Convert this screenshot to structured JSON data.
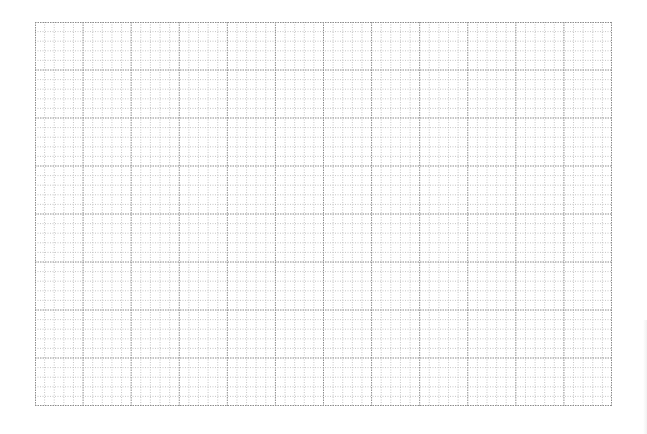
{
  "grid": {
    "columns": 60,
    "rows": 40,
    "major_every": 5,
    "minor_color": "#b8b8b8",
    "major_color": "#8c8c8c",
    "border_color": "#8c8c8c",
    "background": "#ffffff"
  }
}
